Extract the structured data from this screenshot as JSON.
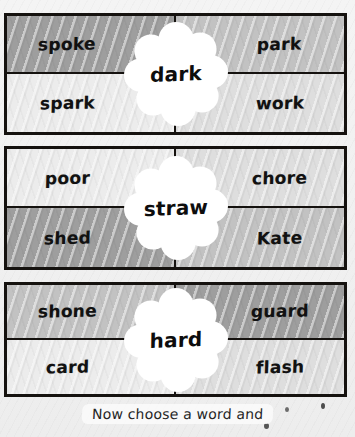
{
  "worksheet": {
    "caption": "Now choose a word and",
    "boxes": [
      {
        "center_word": "dark",
        "cells": [
          {
            "word": "spoke",
            "shade": "sh-dark"
          },
          {
            "word": "park",
            "shade": "sh-mid"
          },
          {
            "word": "spark",
            "shade": "sh-pale"
          },
          {
            "word": "work",
            "shade": "sh-light"
          }
        ]
      },
      {
        "center_word": "straw",
        "cells": [
          {
            "word": "poor",
            "shade": "sh-pale"
          },
          {
            "word": "chore",
            "shade": "sh-light"
          },
          {
            "word": "shed",
            "shade": "sh-dark"
          },
          {
            "word": "Kate",
            "shade": "sh-mid"
          }
        ]
      },
      {
        "center_word": "hard",
        "cells": [
          {
            "word": "shone",
            "shade": "sh-mid"
          },
          {
            "word": "guard",
            "shade": "sh-dark"
          },
          {
            "word": "card",
            "shade": "sh-pale"
          },
          {
            "word": "flash",
            "shade": "sh-light"
          }
        ]
      }
    ]
  },
  "colors": {
    "border": "#15120f",
    "text": "#111111",
    "flower": "#ffffff",
    "page_bg": "#f2f2f2"
  }
}
